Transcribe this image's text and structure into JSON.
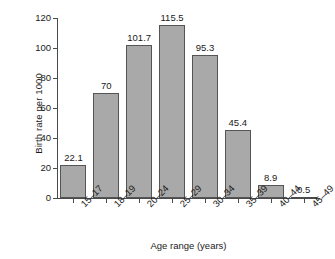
{
  "chart_data": {
    "type": "bar",
    "title": "",
    "xlabel": "Age range (years)",
    "ylabel": "Birth rate per 1000",
    "categories": [
      "15–17",
      "18–19",
      "20–24",
      "25–29",
      "30–34",
      "35–39",
      "40–44",
      "45–49"
    ],
    "values": [
      22.1,
      70,
      101.7,
      115.5,
      95.3,
      45.4,
      8.9,
      0.5
    ],
    "value_labels": [
      "22.1",
      "70",
      "101.7",
      "115.5",
      "95.3",
      "45.4",
      "8.9",
      "0.5"
    ],
    "ylim": [
      0,
      120
    ],
    "yticks": [
      0,
      20,
      40,
      60,
      80,
      100,
      120
    ],
    "ytick_labels": [
      "0",
      "20",
      "40",
      "60",
      "80",
      "100",
      "120"
    ],
    "grid": false,
    "legend": false,
    "bar_color": "#a9a9a9",
    "bar_edge_color": "#555555",
    "axis_color": "#4a4a4a",
    "background": "#ffffff"
  }
}
